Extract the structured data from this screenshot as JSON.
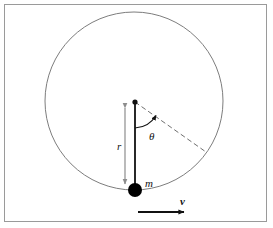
{
  "figure": {
    "frame": {
      "border_color": "#9a9a9a",
      "background": "#ffffff"
    },
    "labels": {
      "radius": "r",
      "mass": "m",
      "velocity": "v",
      "angle": "θ"
    },
    "colors": {
      "stroke_dark": "#111111",
      "stroke_gray": "#8d8d8d",
      "circle": "#7d7d7d",
      "dashed": "#6f6f6f",
      "mass_fill": "#000000"
    },
    "geometry": {
      "circle_center_x": 134,
      "circle_center_y": 101,
      "circle_radius": 89,
      "mass_x": 135,
      "mass_y": 190,
      "mass_radius": 7,
      "center_dot_x": 135,
      "center_dot_y": 102,
      "radius_arrow_x": 125,
      "radius_arrow_top_y": 102,
      "radius_arrow_bottom_y": 189,
      "dashed_end_x": 206,
      "dashed_end_y": 152,
      "theta_arc_radius": 26,
      "velocity_arrow_x1": 138,
      "velocity_arrow_x2": 189,
      "velocity_arrow_y": 212
    }
  }
}
